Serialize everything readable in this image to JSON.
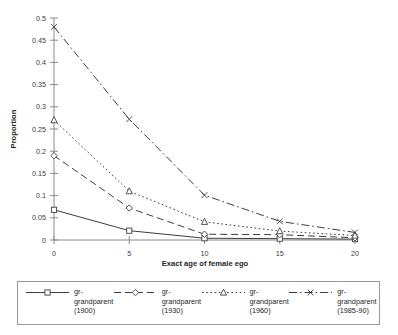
{
  "chart_data": {
    "type": "line",
    "title": "",
    "xlabel": "Exact age of female ego",
    "ylabel": "Proportion",
    "x": [
      0,
      5,
      10,
      15,
      20
    ],
    "xticklabels": [
      "0",
      "5",
      "10",
      "15",
      "20"
    ],
    "xlim": [
      0,
      20
    ],
    "ylim": [
      0,
      0.5
    ],
    "yticks": [
      0,
      0.05,
      0.1,
      0.15,
      0.2,
      0.25,
      0.3,
      0.35,
      0.4,
      0.45,
      0.5
    ],
    "yticklabels": [
      "0",
      "0.05",
      "0.1",
      "0.15",
      "0.2",
      "0.25",
      "0.3",
      "0.35",
      "0.4",
      "0.45",
      "0.5"
    ],
    "grid": false,
    "legend_position": "bottom",
    "series": [
      {
        "name": "gr-\ngrandparent\n(1900)",
        "label_line1": "gr-",
        "label_line2": "grandparent",
        "label_line3": "(1900)",
        "marker": "open-square",
        "dash": "solid",
        "color": "#3d3d3d",
        "values": [
          0.068,
          0.021,
          0.004,
          0.003,
          0.002
        ]
      },
      {
        "name": "gr-\ngrandparent\n(1930)",
        "label_line1": "gr-",
        "label_line2": "grandparent",
        "label_line3": "(1930)",
        "marker": "open-diamond",
        "dash": "dashed",
        "color": "#3d3d3d",
        "values": [
          0.19,
          0.072,
          0.013,
          0.012,
          0.005
        ]
      },
      {
        "name": "gr-\ngrandparent\n(1960)",
        "label_line1": "gr-",
        "label_line2": "grandparent",
        "label_line3": "(1960)",
        "marker": "open-triangle",
        "dash": "dotted",
        "color": "#3d3d3d",
        "values": [
          0.27,
          0.11,
          0.041,
          0.02,
          0.01
        ]
      },
      {
        "name": "gr-\ngrandparent\n(1985-90)",
        "label_line1": "gr-",
        "label_line2": "grandparent",
        "label_line3": "(1985-90)",
        "marker": "cross-x",
        "dash": "dash-dot",
        "color": "#3d3d3d",
        "values": [
          0.48,
          0.272,
          0.101,
          0.042,
          0.017
        ]
      }
    ]
  },
  "axes": {
    "ylabel": "Proportion",
    "xlabel": "Exact age of female ego"
  },
  "legend": {
    "entries": [
      {
        "line1": "gr-",
        "line2": "grandparent",
        "line3": "(1900)"
      },
      {
        "line1": "gr-",
        "line2": "grandparent",
        "line3": "(1930)"
      },
      {
        "line1": "gr-",
        "line2": "grandparent",
        "line3": "(1960)"
      },
      {
        "line1": "gr-",
        "line2": "grandparent",
        "line3": "(1985-90)"
      }
    ]
  },
  "colors": {
    "ink": "#3d3d3d",
    "axis": "#8a8a8a",
    "background": "#ffffff"
  }
}
